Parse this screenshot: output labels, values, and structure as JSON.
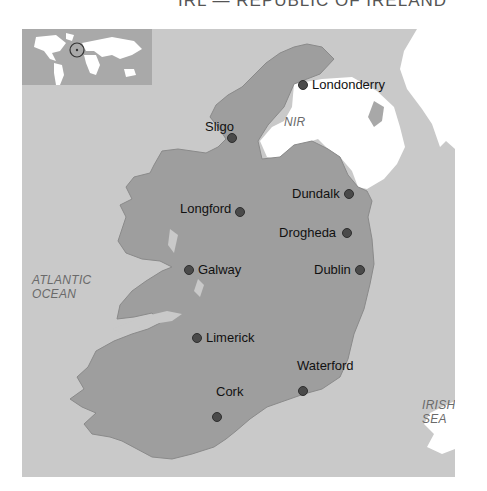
{
  "title": "IRL — REPUBLIC OF IRELAND",
  "colors": {
    "sea": "#c9c9c9",
    "republic_land": "#9e9e9e",
    "northern_ireland": "#ffffff",
    "other_land": "#ffffff",
    "inset_sea": "#a9a9a9",
    "city_dot": "#4a4a4a"
  },
  "inset": {
    "label": "world-locator-map",
    "highlight": "Ireland"
  },
  "regions": {
    "nir": "NIR",
    "atlantic_line1": "ATLANTIC",
    "atlantic_line2": "OCEAN",
    "irish_line1": "IRISH",
    "irish_line2": "SEA"
  },
  "cities": [
    {
      "name": "Londonderry"
    },
    {
      "name": "Sligo"
    },
    {
      "name": "Longford"
    },
    {
      "name": "Dundalk"
    },
    {
      "name": "Drogheda"
    },
    {
      "name": "Galway"
    },
    {
      "name": "Dublin"
    },
    {
      "name": "Limerick"
    },
    {
      "name": "Waterford"
    },
    {
      "name": "Cork"
    }
  ]
}
